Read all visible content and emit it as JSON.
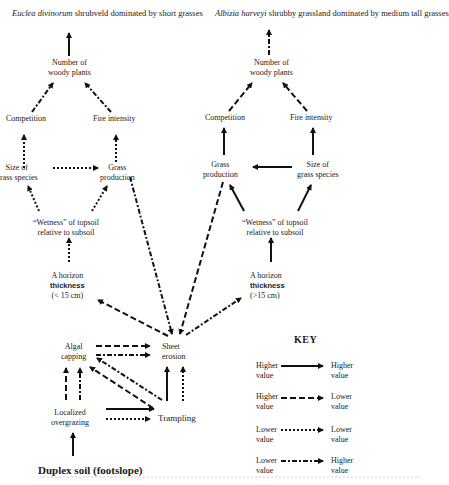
{
  "left_panel": {
    "title_italic": "Euclea divinorum",
    "title_rest": " shrubveld dominated by short grasses",
    "nodes": {
      "woody_line1": "Number of",
      "woody_line2": "woody plants",
      "competition": "Competition",
      "fire": "Fire intensity",
      "size_line1": "Size of",
      "size_line2": "grass species",
      "grass_line1": "Grass",
      "grass_line2": "production",
      "wetness_line1": "“Wetness” of topsoil",
      "wetness_line2": "relative to subsoil",
      "horizon_line1": "A horizon",
      "horizon_line2": "thickness",
      "horizon_line3": "(< 15 cm)"
    }
  },
  "right_panel": {
    "title_italic": "Albizia harveyi",
    "title_rest": " shrubby grassland dominated by medium tall grasses",
    "nodes": {
      "woody_line1": "Number of",
      "woody_line2": "woody plants",
      "competition": "Competition",
      "fire": "Fire intensity",
      "grass_line1": "Grass",
      "grass_line2": "production",
      "size_line1": "Size of",
      "size_line2": "grass species",
      "wetness_line1": "“Wetness” of topsoil",
      "wetness_line2": "relative to subsoil",
      "horizon_line1": "A horizon",
      "horizon_line2": "thickness",
      "horizon_line3": "(>15 cm)"
    }
  },
  "bottom": {
    "algal_line1": "Algal",
    "algal_line2": "capping",
    "sheet_line1": "Sheet",
    "sheet_line2": "erosion",
    "overgrazing_line1": "Localized",
    "overgrazing_line2": "overgrazing",
    "trampling": "Trampling",
    "root": "Duplex soil (footslope)"
  },
  "key": {
    "title": "KEY",
    "rows": [
      {
        "from": [
          "Higher",
          "value"
        ],
        "to": [
          "Higher",
          "value"
        ],
        "style": "solid"
      },
      {
        "from": [
          "Higher",
          "value"
        ],
        "to": [
          "Lower",
          "value"
        ],
        "style": "dashed"
      },
      {
        "from": [
          "Lower",
          "value"
        ],
        "to": [
          "Lower",
          "value"
        ],
        "style": "dotted"
      },
      {
        "from": [
          "Lower",
          "value"
        ],
        "to": [
          "Higher",
          "value"
        ],
        "style": "dash-dot"
      }
    ]
  }
}
